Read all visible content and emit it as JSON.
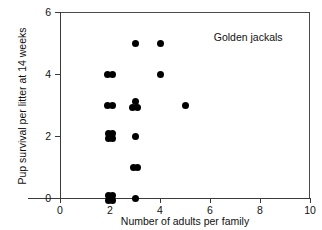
{
  "chart_data": {
    "type": "scatter",
    "title": "",
    "xlabel": "Number of adults per family",
    "ylabel": "Pup survival per litter at 14 weeks",
    "xlim": [
      0,
      10
    ],
    "ylim": [
      0,
      6
    ],
    "xticks": [
      0,
      2,
      4,
      6,
      8,
      10
    ],
    "yticks": [
      0,
      2,
      4,
      6
    ],
    "xticklabels": [
      "0",
      "2",
      "4",
      "6",
      "8",
      "10"
    ],
    "yticklabels": [
      "0",
      "2",
      "4",
      "6"
    ],
    "grid": false,
    "legend": null,
    "annotations": [
      {
        "text": "Golden jackals",
        "x": 6.15,
        "y": 5.15
      }
    ],
    "marker": {
      "shape": "circle",
      "color": "#000000",
      "size_px": 7
    },
    "points": [
      {
        "x": 2,
        "y": 4,
        "count": 2,
        "jitter": [
          [
            -0.085,
            0
          ],
          [
            0.085,
            0
          ]
        ]
      },
      {
        "x": 2,
        "y": 3,
        "count": 2,
        "jitter": [
          [
            -0.085,
            0
          ],
          [
            0.085,
            0
          ]
        ]
      },
      {
        "x": 2,
        "y": 2,
        "count": 4,
        "jitter": [
          [
            -0.08,
            0.09
          ],
          [
            0.08,
            0.09
          ],
          [
            -0.08,
            -0.09
          ],
          [
            0.08,
            -0.09
          ]
        ]
      },
      {
        "x": 2,
        "y": 0,
        "count": 4,
        "jitter": [
          [
            -0.08,
            0.09
          ],
          [
            0.08,
            0.09
          ],
          [
            -0.08,
            -0.09
          ],
          [
            0.08,
            -0.09
          ]
        ]
      },
      {
        "x": 3,
        "y": 5,
        "count": 1,
        "jitter": [
          [
            0,
            0
          ]
        ]
      },
      {
        "x": 3,
        "y": 3,
        "count": 3,
        "jitter": [
          [
            0,
            0.11
          ],
          [
            -0.09,
            -0.08
          ],
          [
            0.09,
            -0.08
          ]
        ]
      },
      {
        "x": 3,
        "y": 2,
        "count": 1,
        "jitter": [
          [
            0,
            0
          ]
        ]
      },
      {
        "x": 3,
        "y": 1,
        "count": 2,
        "jitter": [
          [
            -0.08,
            0
          ],
          [
            0.08,
            0
          ]
        ]
      },
      {
        "x": 3,
        "y": 0,
        "count": 1,
        "jitter": [
          [
            0,
            0
          ]
        ]
      },
      {
        "x": 4,
        "y": 5,
        "count": 1,
        "jitter": [
          [
            0,
            0
          ]
        ]
      },
      {
        "x": 4,
        "y": 4,
        "count": 1,
        "jitter": [
          [
            0,
            0
          ]
        ]
      },
      {
        "x": 5,
        "y": 3,
        "count": 1,
        "jitter": [
          [
            0,
            0
          ]
        ]
      }
    ],
    "total_observations": 23
  }
}
